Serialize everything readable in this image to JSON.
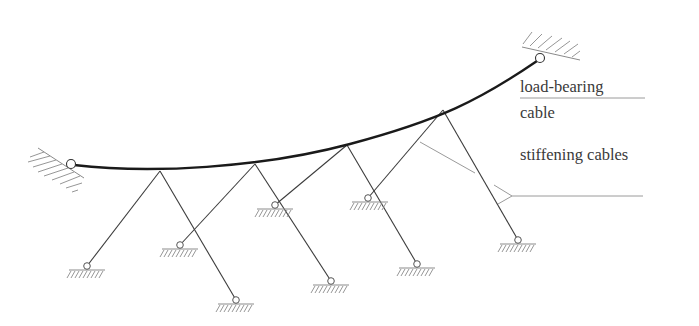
{
  "diagram": {
    "labels": {
      "load_bearing_line1": "load-bearing",
      "load_bearing_line2": "cable",
      "stiffening": "stiffening cables"
    },
    "colors": {
      "cable": "#1a1a1a",
      "stay": "#3c3c3c",
      "hatch": "#8a8a8a",
      "leader": "#9a9a9a",
      "text": "#3a3a3a"
    }
  }
}
